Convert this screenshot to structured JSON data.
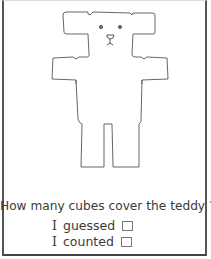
{
  "worksheet": {
    "question": "How many cubes cover the teddy ?",
    "answers": [
      {
        "pronoun": "I",
        "label": "guessed",
        "checked": false
      },
      {
        "pronoun": "I",
        "label": "counted",
        "checked": false
      }
    ]
  },
  "illustration": {
    "subject": "teddy-bear-outline",
    "line_color": "#555555"
  }
}
